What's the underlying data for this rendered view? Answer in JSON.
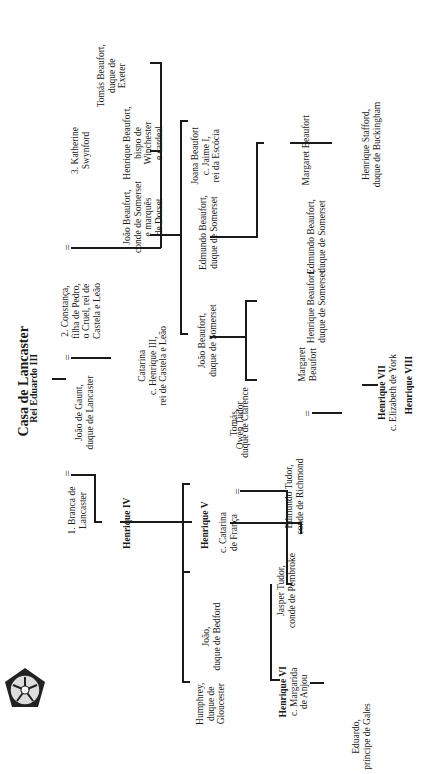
{
  "title": "Casa de Lancaster",
  "root": "Rei Eduardo III",
  "emblem": "tudor-rose-icon",
  "marriage_symbol": "=",
  "persons": {
    "joao_gaunt": [
      "João de Gaunt,",
      "duque de Lancaster"
    ],
    "branca": [
      "1. Branca de",
      "Lancaster"
    ],
    "constanca": [
      "2. Constança,",
      "filha de Pedro,",
      "o Cruel, rei de",
      "Castela e Leão"
    ],
    "katherine": [
      "3. Katherine",
      "Swynford"
    ],
    "henrique_iv": [
      "Henrique IV"
    ],
    "catarina_castela": [
      "Catarina",
      "c. Henrique III,",
      "rei de Castela e Leão"
    ],
    "joao_beaufort_conde": [
      "João Beaufort,",
      "conde de Somerset",
      "e marquês",
      "de Dorset"
    ],
    "henrique_beaufort_bispo": [
      "Henrique Beaufort,",
      "bispo de",
      "Winchester",
      "e cardeal"
    ],
    "tomas_beaufort": [
      "Tomás Beaufort,",
      "duque de",
      "Exeter"
    ],
    "humphrey": [
      "Humphrey,",
      "duque de",
      "Gloucester"
    ],
    "joao_bedford": [
      "João,",
      "duque de Bedford"
    ],
    "henrique_v": [
      "Henrique V"
    ],
    "catarina_franca": [
      "c. Catarina",
      "de França"
    ],
    "owen_tudor": [
      "Owen Tudor"
    ],
    "tomas_clarence": [
      "Tomás,",
      "duque de Clarence"
    ],
    "joao_beaufort_duque": [
      "João Beaufort,",
      "duque de Somerset"
    ],
    "edmundo_beaufort_1": [
      "Edmundo Beaufort,",
      "duque de Somerset"
    ],
    "joana_beaufort": [
      "Joana Beaufort",
      "c. Jaime I,",
      "rei da Escócia"
    ],
    "henrique_vi": [
      "Henrique VI",
      "c. Margarida",
      "de Anjou"
    ],
    "jasper_tudor": [
      "Jasper Tudor,",
      "conde de Pembroke"
    ],
    "edmundo_tudor": [
      "Edmundo Tudor,",
      "conde de Richmond"
    ],
    "margaret_beaufort_1": [
      "Margaret",
      "Beaufort"
    ],
    "henrique_beaufort_duque": [
      "Henrique Beaufort,",
      "duque de Somerset"
    ],
    "edmundo_beaufort_2": [
      "Edmundo Beaufort,",
      "duque de Somerset"
    ],
    "margaret_beaufort_2": [
      "Margaret Beaufort"
    ],
    "henrique_stafford": [
      "Henrique Stafford,",
      "duque de Buckingham"
    ],
    "eduardo_gales": [
      "Eduardo,",
      "príncipe de Gales"
    ],
    "henrique_vii": [
      "Henrique VII",
      "c. Elizabeth de York"
    ],
    "henrique_viii": [
      "Henrique VIII"
    ]
  }
}
